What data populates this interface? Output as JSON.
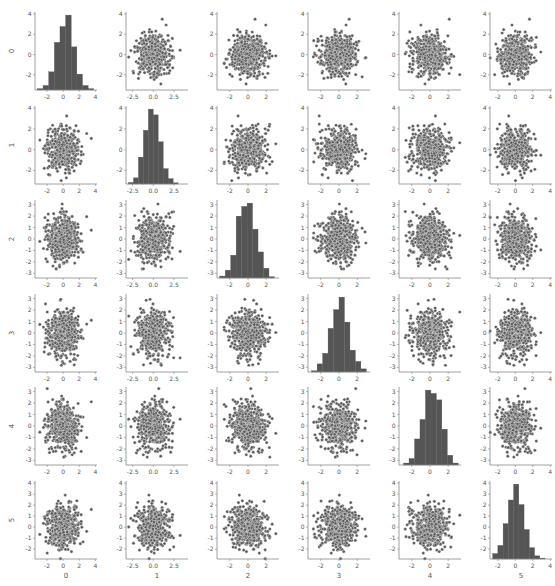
{
  "chart_data": {
    "type": "pairplot",
    "title": "",
    "variables": [
      "0",
      "1",
      "2",
      "3",
      "4",
      "5"
    ],
    "n_points": 500,
    "diagonal": "hist",
    "offdiagonal": "scatter",
    "colors": {
      "point": "#5a5a5a",
      "point_edge": "#ffffff",
      "bar": "#555555",
      "axis": "#888888",
      "text": "#555555"
    },
    "axis_ranges": {
      "0": [
        -3.5,
        4.2
      ],
      "1": [
        -3.3,
        4.2
      ],
      "2": [
        -3.4,
        3.4
      ],
      "3": [
        -3.4,
        3.4
      ],
      "4": [
        -3.4,
        3.4
      ],
      "5": [
        -2.9,
        4.2
      ]
    },
    "x_ticks": {
      "0": [
        "-2",
        "0",
        "2",
        "4"
      ],
      "1": [
        "-2.5",
        "0.0",
        "2.5"
      ],
      "2": [
        "-2",
        "0",
        "2"
      ],
      "3": [
        "-2",
        "0",
        "2"
      ],
      "4": [
        "-2",
        "0",
        "2"
      ],
      "5": [
        "-2",
        "0",
        "2",
        "4"
      ]
    },
    "x_tick_values": {
      "0": [
        -2,
        0,
        2,
        4
      ],
      "1": [
        -2.5,
        0,
        2.5
      ],
      "2": [
        -2,
        0,
        2
      ],
      "3": [
        -2,
        0,
        2
      ],
      "4": [
        -2,
        0,
        2
      ],
      "5": [
        -2,
        0,
        2,
        4
      ]
    },
    "y_ticks": {
      "0": [
        "-2",
        "0",
        "2",
        "4"
      ],
      "1": [
        "-2",
        "0",
        "2",
        "4"
      ],
      "2": [
        "-3",
        "-2",
        "-1",
        "0",
        "1",
        "2",
        "3"
      ],
      "3": [
        "-3",
        "-2",
        "-1",
        "0",
        "1",
        "2",
        "3"
      ],
      "4": [
        "-3",
        "-2",
        "-1",
        "0",
        "1",
        "2",
        "3"
      ],
      "5": [
        "-2",
        "-1",
        "0",
        "1",
        "2",
        "3",
        "4"
      ]
    },
    "y_tick_values": {
      "0": [
        -2,
        0,
        2,
        4
      ],
      "1": [
        -2,
        0,
        2,
        4
      ],
      "2": [
        -3,
        -2,
        -1,
        0,
        1,
        2,
        3
      ],
      "3": [
        -3,
        -2,
        -1,
        0,
        1,
        2,
        3
      ],
      "4": [
        -3,
        -2,
        -1,
        0,
        1,
        2,
        3
      ],
      "5": [
        -2,
        -1,
        0,
        1,
        2,
        3,
        4
      ]
    },
    "histograms": {
      "0": {
        "edges": [
          -3.2,
          -2.5,
          -1.8,
          -1.1,
          -0.4,
          0.3,
          1.0,
          1.7,
          2.4,
          3.1,
          3.8
        ],
        "counts": [
          3,
          10,
          40,
          105,
          140,
          165,
          95,
          35,
          10,
          3
        ]
      },
      "1": {
        "edges": [
          -3.0,
          -2.4,
          -1.8,
          -1.2,
          -0.6,
          0.0,
          0.6,
          1.2,
          1.8,
          2.4,
          3.0
        ],
        "counts": [
          4,
          16,
          70,
          140,
          195,
          180,
          110,
          40,
          14,
          3
        ]
      },
      "2": {
        "edges": [
          -3.1,
          -2.5,
          -1.9,
          -1.3,
          -0.7,
          -0.1,
          0.5,
          1.1,
          1.7,
          2.3,
          2.9
        ],
        "counts": [
          3,
          12,
          35,
          95,
          110,
          115,
          75,
          40,
          15,
          2
        ]
      },
      "3": {
        "edges": [
          -3.0,
          -2.4,
          -1.8,
          -1.2,
          -0.6,
          0.0,
          0.6,
          1.2,
          1.8,
          2.4,
          3.0
        ],
        "counts": [
          2,
          13,
          30,
          70,
          100,
          120,
          80,
          35,
          17,
          5
        ]
      },
      "4": {
        "edges": [
          -2.9,
          -2.3,
          -1.7,
          -1.1,
          -0.5,
          0.1,
          0.7,
          1.3,
          1.9,
          2.5,
          3.1
        ],
        "counts": [
          3,
          10,
          40,
          70,
          115,
          110,
          100,
          55,
          15,
          3
        ]
      },
      "5": {
        "edges": [
          -2.6,
          -2.0,
          -1.4,
          -0.8,
          -0.2,
          0.4,
          1.0,
          1.6,
          2.2,
          2.8,
          3.4
        ],
        "counts": [
          12,
          30,
          78,
          130,
          165,
          120,
          65,
          25,
          7,
          2
        ]
      }
    },
    "axis_labels": {
      "x": [
        "0",
        "1",
        "2",
        "3",
        "4",
        "5"
      ],
      "y": [
        "0",
        "1",
        "2",
        "3",
        "4",
        "5"
      ]
    },
    "grid": false,
    "legend": null,
    "seed": 42
  }
}
